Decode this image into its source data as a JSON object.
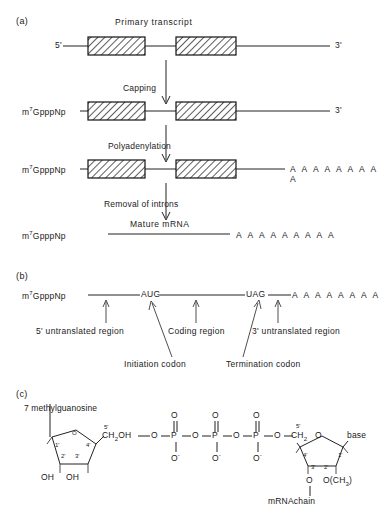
{
  "figure": {
    "panels": [
      "(a)",
      "(b)",
      "(c)"
    ]
  },
  "panel_a": {
    "label": "(a)",
    "title": "Primary transcript",
    "rows": [
      {
        "left_label": "5'",
        "right_label": "3'",
        "name": "primary-transcript-row"
      },
      {
        "left_label": "m7GpppNp",
        "left_label_base": "m",
        "left_label_sup": "7",
        "left_label_rest": "GpppNp",
        "right_label": "3'",
        "name": "capped-transcript-row"
      },
      {
        "left_label_base": "m",
        "left_label_sup": "7",
        "left_label_rest": "GpppNp",
        "right_label": "A A A A A A A A A",
        "name": "polyadenylated-row"
      },
      {
        "left_label_base": "m",
        "left_label_sup": "7",
        "left_label_rest": "GpppNp",
        "center_label": "Mature mRNA",
        "right_label": "A A A A A A A A A",
        "name": "mature-mrna-row"
      }
    ],
    "steps": [
      {
        "label": "Capping",
        "name": "step-capping"
      },
      {
        "label": "Polyadenylation",
        "name": "step-polyadenylation"
      },
      {
        "label": "Removal of introns",
        "name": "step-removal-of-introns"
      }
    ]
  },
  "panel_b": {
    "label": "(b)",
    "cap_base": "m",
    "cap_sup": "7",
    "cap_rest": "GpppNp",
    "start_codon": "AUG",
    "stop_codon": "UAG",
    "poly_a": "A A A A A A A A",
    "annotations": [
      {
        "text": "5' untranslated region",
        "name": "annot-5utr"
      },
      {
        "text": "Coding region",
        "name": "annot-coding-region"
      },
      {
        "text": "3' untranslated region",
        "name": "annot-3utr"
      },
      {
        "text": "Initiation codon",
        "name": "annot-initiation-codon"
      },
      {
        "text": "Termination codon",
        "name": "annot-termination-codon"
      }
    ]
  },
  "panel_c": {
    "label": "(c)",
    "title": "7 methylguanosine",
    "left_ring": {
      "ring_o": "O",
      "pos1": "1'",
      "pos2": "2'",
      "pos3": "3'",
      "pos4": "4'",
      "pos5": "5'",
      "ch2oh_c": "CH",
      "ch2oh_sub": "2",
      "ch2oh_oh": "OH",
      "oh_left": "OH",
      "oh_right": "OH"
    },
    "phosphates": {
      "bridge_o": "O",
      "p": "P",
      "double_o": "O",
      "minus_o": "O",
      "minus_sign": "-"
    },
    "right_ring": {
      "pos1": "1'",
      "pos2": "2'",
      "pos3": "3'",
      "pos4": "4'",
      "pos5": "5'",
      "ch2_c": "CH",
      "ch2_sub": "2",
      "ring_o": "O",
      "base": "base",
      "o_link": "O",
      "o_methyl_o": "O(CH",
      "o_methyl_sub": "3",
      "o_methyl_close": ")",
      "chain_label": "mRNAchain"
    }
  },
  "colors": {
    "ink": "#1a1a1a",
    "line": "#222222",
    "hatch": "#333333",
    "paper": "#ffffff"
  }
}
